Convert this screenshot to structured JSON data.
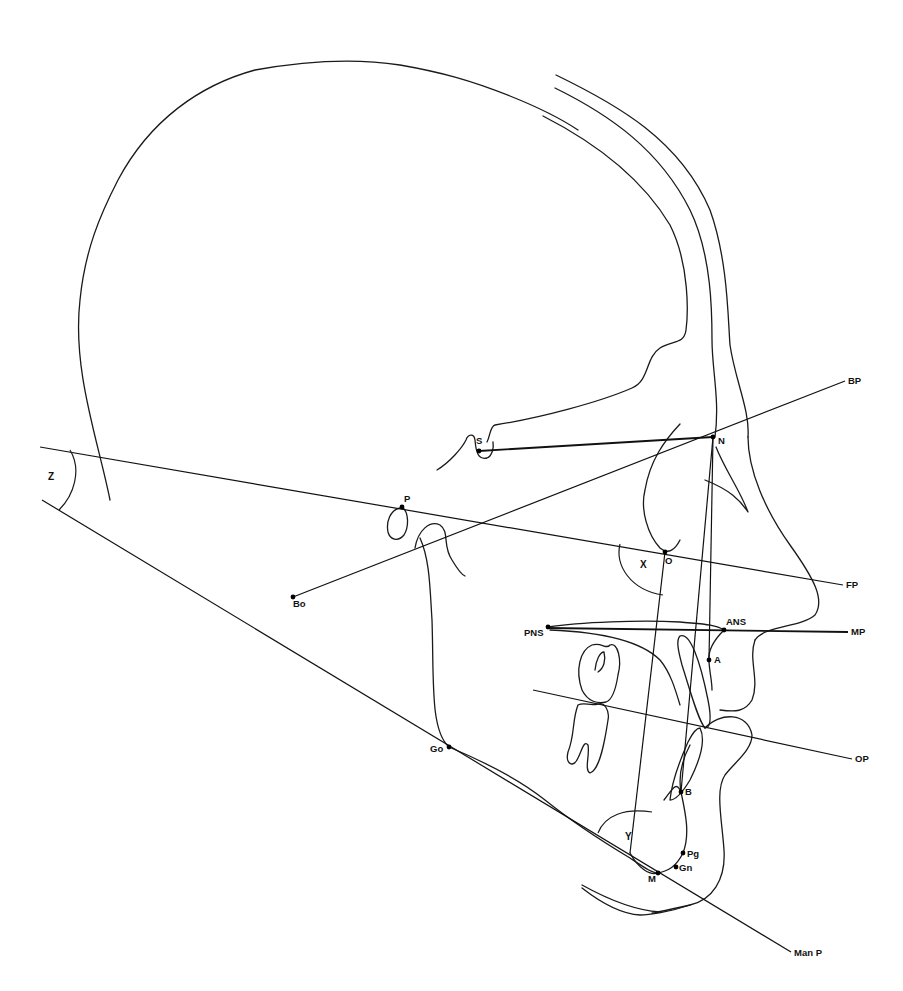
{
  "diagram": {
    "type": "cephalometric tracing (lateral skull profile)",
    "colors": {
      "line": "#111111",
      "background": "#ffffff"
    },
    "landmarks": [
      {
        "id": "S",
        "label": "S",
        "x": 479,
        "y": 451,
        "lx": 476,
        "ly": 444
      },
      {
        "id": "N",
        "label": "N",
        "x": 713,
        "y": 437,
        "lx": 718,
        "ly": 444
      },
      {
        "id": "P",
        "label": "P",
        "x": 402,
        "y": 507,
        "lx": 404,
        "ly": 502
      },
      {
        "id": "O",
        "label": "O",
        "x": 665,
        "y": 552,
        "lx": 665,
        "ly": 564
      },
      {
        "id": "Bo",
        "label": "Bo",
        "x": 293,
        "y": 597,
        "lx": 293,
        "ly": 607
      },
      {
        "id": "PNS",
        "label": "PNS",
        "x": 548,
        "y": 627,
        "lx": 524,
        "ly": 636
      },
      {
        "id": "ANS",
        "label": "ANS",
        "x": 724,
        "y": 630,
        "lx": 726,
        "ly": 625
      },
      {
        "id": "A",
        "label": "A",
        "x": 709,
        "y": 660,
        "lx": 714,
        "ly": 663
      },
      {
        "id": "Go",
        "label": "Go",
        "x": 449,
        "y": 747,
        "lx": 430,
        "ly": 752
      },
      {
        "id": "B",
        "label": "B",
        "x": 681,
        "y": 792,
        "lx": 685,
        "ly": 795
      },
      {
        "id": "Pg",
        "label": "Pg",
        "x": 683,
        "y": 853,
        "lx": 687,
        "ly": 857
      },
      {
        "id": "Gn",
        "label": "Gn",
        "x": 676,
        "y": 867,
        "lx": 679,
        "ly": 871
      },
      {
        "id": "M",
        "label": "M",
        "x": 658,
        "y": 873,
        "lx": 648,
        "ly": 882
      }
    ],
    "reference_lines": [
      {
        "id": "SN",
        "label": "",
        "x1": 479,
        "y1": 451,
        "x2": 713,
        "y2": 437,
        "bold": true
      },
      {
        "id": "BP",
        "label": "BP",
        "x1": 293,
        "y1": 597,
        "x2": 845,
        "y2": 381,
        "lx": 848,
        "ly": 384
      },
      {
        "id": "FP",
        "label": "FP",
        "x1": 40,
        "y1": 447,
        "x2": 843,
        "y2": 585,
        "lx": 846,
        "ly": 588
      },
      {
        "id": "MP",
        "label": "MP",
        "x1": 548,
        "y1": 628,
        "x2": 848,
        "y2": 632,
        "lx": 851,
        "ly": 635,
        "bold": true
      },
      {
        "id": "OP",
        "label": "OP",
        "x1": 533,
        "y1": 690,
        "x2": 852,
        "y2": 759,
        "lx": 855,
        "ly": 762
      },
      {
        "id": "ManP",
        "label": "Man P",
        "x1": 42,
        "y1": 500,
        "x2": 791,
        "y2": 952,
        "lx": 794,
        "ly": 956
      },
      {
        "id": "NA",
        "label": "",
        "x1": 713,
        "y1": 437,
        "x2": 709,
        "y2": 660
      },
      {
        "id": "NB",
        "label": "",
        "x1": 713,
        "y1": 437,
        "x2": 681,
        "y2": 792
      },
      {
        "id": "Y",
        "label": "",
        "x1": 665,
        "y1": 552,
        "x2": 630,
        "y2": 853
      }
    ],
    "angles": [
      {
        "id": "X",
        "label": "X",
        "lx": 640,
        "ly": 568
      },
      {
        "id": "Y",
        "label": "Y",
        "lx": 625,
        "ly": 840
      },
      {
        "id": "Z",
        "label": "Z",
        "lx": 48,
        "ly": 480
      }
    ]
  }
}
